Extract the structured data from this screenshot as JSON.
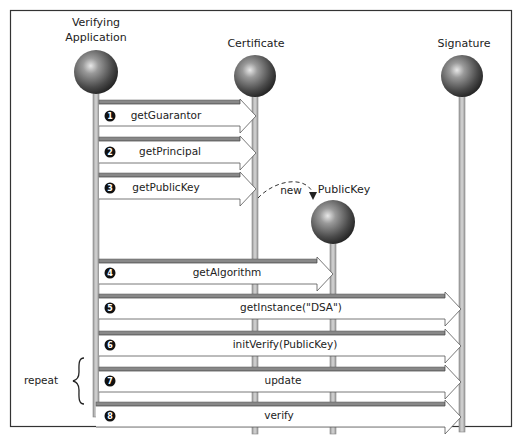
{
  "diagram": {
    "type": "sequence-diagram",
    "objects": [
      {
        "id": "app",
        "label_line1": "Verifying",
        "label_line2": "Application"
      },
      {
        "id": "cert",
        "label": "Certificate"
      },
      {
        "id": "sig",
        "label": "Signature"
      },
      {
        "id": "pk",
        "label": "PublicKey"
      }
    ],
    "creation": {
      "label": "new",
      "from": "cert",
      "to": "pk"
    },
    "messages": [
      {
        "num": "1",
        "label": "getGuarantor",
        "from": "app",
        "to": "cert"
      },
      {
        "num": "2",
        "label": "getPrincipal",
        "from": "app",
        "to": "cert"
      },
      {
        "num": "3",
        "label": "getPublicKey",
        "from": "app",
        "to": "cert"
      },
      {
        "num": "4",
        "label": "getAlgorithm",
        "from": "app",
        "to": "pk"
      },
      {
        "num": "5",
        "label": "getInstance(\"DSA\")",
        "from": "app",
        "to": "sig"
      },
      {
        "num": "6",
        "label": "initVerify(PublicKey)",
        "from": "app",
        "to": "sig"
      },
      {
        "num": "7",
        "label": "update",
        "from": "app",
        "to": "sig"
      },
      {
        "num": "8",
        "label": "verify",
        "from": "app",
        "to": "sig"
      }
    ],
    "repeat_label": "repeat"
  }
}
